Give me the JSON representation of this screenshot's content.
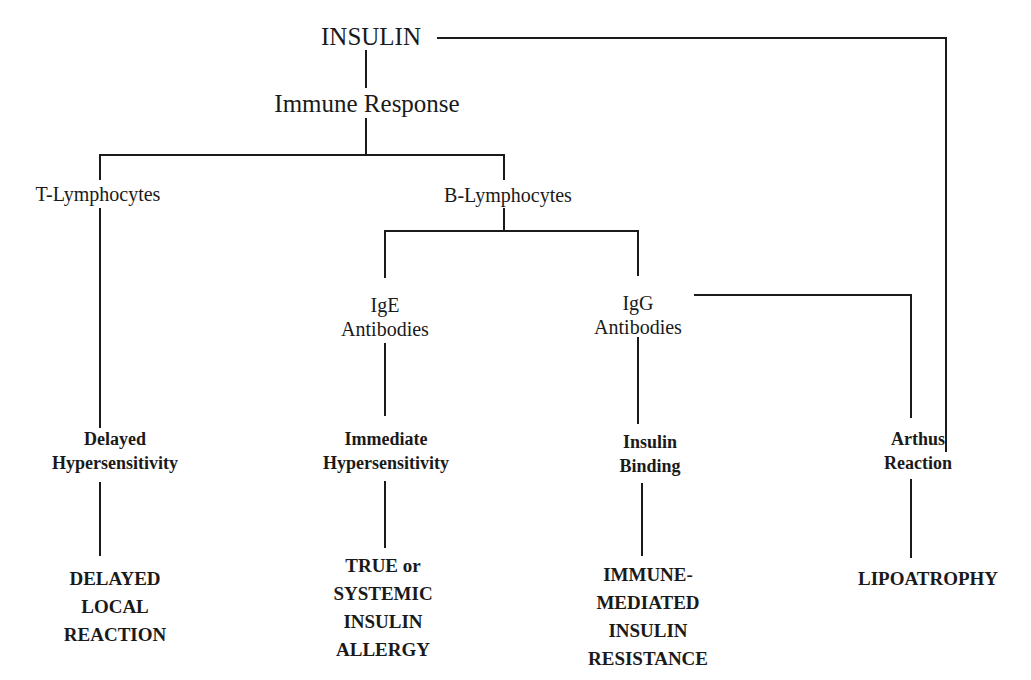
{
  "diagram": {
    "nodes": {
      "insulin": "INSULIN",
      "immune_response": "Immune Response",
      "t_lymphocytes": "T-Lymphocytes",
      "b_lymphocytes": "B-Lymphocytes",
      "ige": "IgE\nAntibodies",
      "igg": "IgG\nAntibodies",
      "delayed_hypersensitivity": "Delayed\nHypersensitivity",
      "immediate_hypersensitivity": "Immediate\nHypersensitivity",
      "insulin_binding": "Insulin\nBinding",
      "arthus_reaction": "Arthus\nReaction",
      "delayed_local_reaction": "DELAYED\nLOCAL\nREACTION",
      "systemic_allergy": "TRUE or\nSYSTEMIC\nINSULIN\nALLERGY",
      "immune_resistance": "IMMUNE-\nMEDIATED\nINSULIN\nRESISTANCE",
      "lipoatrophy": "LIPOATROPHY"
    },
    "edges": [
      [
        "INSULIN",
        "Immune Response"
      ],
      [
        "Immune Response",
        "T-Lymphocytes"
      ],
      [
        "Immune Response",
        "B-Lymphocytes"
      ],
      [
        "B-Lymphocytes",
        "IgE Antibodies"
      ],
      [
        "B-Lymphocytes",
        "IgG Antibodies"
      ],
      [
        "T-Lymphocytes",
        "Delayed Hypersensitivity"
      ],
      [
        "IgE Antibodies",
        "Immediate Hypersensitivity"
      ],
      [
        "IgG Antibodies",
        "Insulin Binding"
      ],
      [
        "IgG Antibodies",
        "Arthus Reaction"
      ],
      [
        "INSULIN",
        "Arthus Reaction"
      ],
      [
        "Delayed Hypersensitivity",
        "DELAYED LOCAL REACTION"
      ],
      [
        "Immediate Hypersensitivity",
        "TRUE or SYSTEMIC INSULIN ALLERGY"
      ],
      [
        "Insulin Binding",
        "IMMUNE-MEDIATED INSULIN RESISTANCE"
      ],
      [
        "Arthus Reaction",
        "LIPOATROPHY"
      ]
    ]
  }
}
